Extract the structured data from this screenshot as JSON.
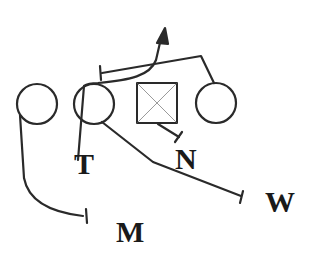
{
  "diagram": {
    "type": "football-play",
    "colors": {
      "stroke": "#2a2a2a",
      "square_x": "#9a9a9a",
      "label": "#1a1a1a",
      "background": "#ffffff"
    },
    "players": [
      {
        "id": "circle-left",
        "shape": "circle"
      },
      {
        "id": "circle-left-center",
        "shape": "circle"
      },
      {
        "id": "center-square",
        "shape": "square-with-x"
      },
      {
        "id": "circle-right",
        "shape": "circle"
      }
    ],
    "labels": {
      "T": "T",
      "N": "N",
      "W": "W",
      "M": "M"
    }
  }
}
